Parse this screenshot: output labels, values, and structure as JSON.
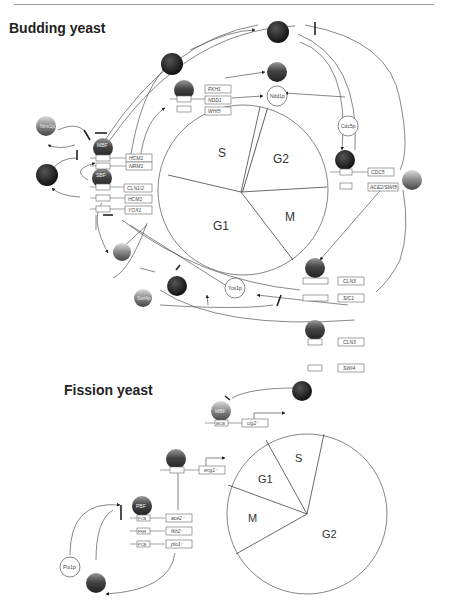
{
  "budding": {
    "title": "Budding yeast",
    "cycle_phases": [
      "S",
      "G2",
      "G1",
      "M"
    ],
    "proteins": {
      "nrm1": "Nrm1p",
      "mbf": "MBF",
      "sbf": "SBF",
      "whi5": "Whi5p",
      "swi4p": "Swi4p",
      "yox1": "Yox1p",
      "ndd1": "Ndd1p",
      "fkh": "Fkh2p",
      "mcm1": "Mcm1p",
      "cdc5": "Cdc5p",
      "ace2swi5": "Ace2/Swi5",
      "mcm1b": "Mcm1p"
    },
    "genes": {
      "hcm1_mcb": "HCM1",
      "nrm1_mcb": "NRM1",
      "cln12": "CLN1/2",
      "hcm1_scb": "HCM1",
      "yox1": "YOX1",
      "fkh1": "FKH1",
      "ndd1": "NDD1",
      "whi5": "WHI5",
      "cdc5": "CDC5",
      "ace2swi5": "ACE2/SWI5",
      "cln3a": "CLN3",
      "sic1": "SIC1",
      "cln3b": "CLN3",
      "swi4": "SWI4"
    },
    "elements": {
      "mcb": "MCB",
      "scb": "SCB",
      "sff": "SFF",
      "ace2swi5": "ACE2/SWI5",
      "ecb": "ECB"
    }
  },
  "fission": {
    "title": "Fission yeast",
    "cycle_phases": [
      "S",
      "G1",
      "M",
      "G2"
    ],
    "proteins": {
      "mbf": "MBF",
      "pbf": "PBF",
      "sep1": "Sep1p",
      "plo1": "Plo1p",
      "cdc15": "Cdc15p"
    },
    "genes": {
      "cig2": "cig2⁺",
      "eng1": "eng1⁺",
      "ace2": "ace2⁺",
      "fkh2": "fkh2⁺",
      "plo1": "plo1⁺"
    },
    "elements": {
      "mcb": "MCB",
      "pcb": "PCB",
      "fkh": "FKH"
    }
  }
}
